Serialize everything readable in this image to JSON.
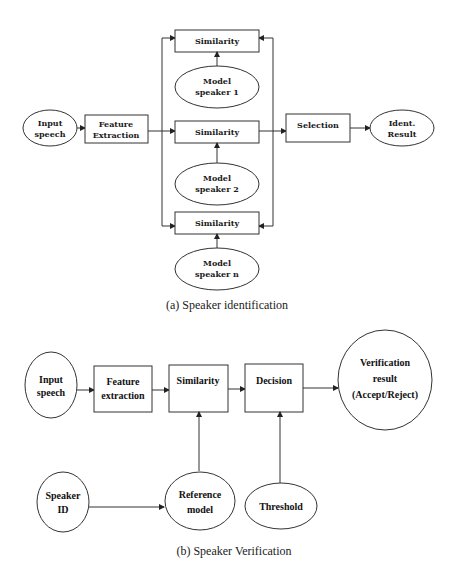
{
  "diagram_a": {
    "caption": "(a) Speaker identification",
    "nodes": {
      "input_speech": [
        "Input",
        "speech"
      ],
      "feature_extraction": [
        "Feature",
        "Extraction"
      ],
      "similarity_1": "Similarity",
      "similarity_2": "Similarity",
      "similarity_n": "Similarity",
      "model_speaker_1": [
        "Model",
        "speaker 1"
      ],
      "model_speaker_2": [
        "Model",
        "speaker 2"
      ],
      "model_speaker_n": [
        "Model",
        "speaker n"
      ],
      "selection": "Selection",
      "ident_result": [
        "Ident.",
        "Result"
      ]
    }
  },
  "diagram_b": {
    "caption": "(b) Speaker Verification",
    "nodes": {
      "input_speech": [
        "Input",
        "speech"
      ],
      "feature_extraction": [
        "Feature",
        "extraction"
      ],
      "similarity": "Similarity",
      "decision": "Decision",
      "verification_result": [
        "Verification",
        "result",
        "(Accept/Reject)"
      ],
      "speaker_id": [
        "Speaker",
        "ID"
      ],
      "reference_model": [
        "Reference",
        "model"
      ],
      "threshold": "Threshold"
    }
  }
}
